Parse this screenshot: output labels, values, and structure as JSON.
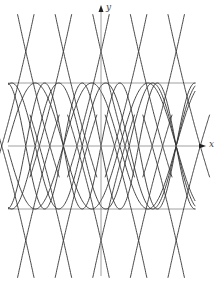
{
  "figure": {
    "type": "function-graph",
    "axes": {
      "x_label": "x",
      "y_label": "y",
      "origin_px": [
        101,
        146
      ],
      "unit_x_px": 37.6,
      "unit_y_px": 63,
      "x_range_px": [
        8,
        203
      ],
      "y_range_px": [
        8,
        276
      ]
    },
    "reference_lines": [
      {
        "name": "line-y-plus-1",
        "value": 1
      },
      {
        "name": "line-y-minus-1",
        "value": -1
      }
    ],
    "colors": {
      "curve": "#333333",
      "axis": "#888888",
      "ref_line": "#888888"
    },
    "families": [
      {
        "name": "sine-waves",
        "kind": "sin",
        "amplitude": 1,
        "periods": [
          2.0,
          2.5,
          3.0
        ],
        "phases": [
          0,
          0.5,
          1.0
        ]
      },
      {
        "name": "reciprocal-branches",
        "kind": "sec",
        "crossings_x": [
          -2,
          -1,
          0,
          1,
          2
        ],
        "cross_y": [
          1.5,
          -1.5
        ]
      }
    ]
  }
}
